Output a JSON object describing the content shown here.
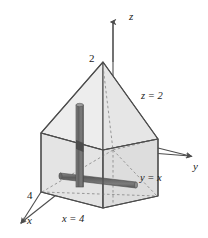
{
  "figure": {
    "background_color": "#ffffff",
    "stroke_color": "#4d4d4d",
    "dashed_color": "#8c8c8c",
    "face_fill_light": "#eeeeee",
    "face_fill_mid": "#e3e3e3",
    "face_fill_dark": "#d9d9d9",
    "rod_color": "#6e6e6e",
    "rod_shadow_color": "#4a4a4a",
    "axes": {
      "z": {
        "label": "z",
        "x": 129,
        "y": 20
      },
      "y": {
        "label": "y",
        "x": 193,
        "y": 160
      },
      "x": {
        "label": "x",
        "x": 27,
        "y": 221
      }
    },
    "tick_labels": [
      {
        "name": "z-tick-2",
        "text": "2",
        "x": 89,
        "y": 62
      },
      {
        "name": "x-tick-4",
        "text": "4",
        "x": 29,
        "y": 198
      }
    ],
    "plane_labels": [
      {
        "name": "plane-z-equals-2",
        "text": "z = 2",
        "x": 143,
        "y": 98
      },
      {
        "name": "plane-y-equals-x",
        "text": "y = x",
        "x": 142,
        "y": 180
      },
      {
        "name": "plane-x-equals-4",
        "text": "x = 4",
        "x": 66,
        "y": 219
      }
    ],
    "elements": [
      {
        "name": "vertical-rod",
        "orientation": "vertical"
      },
      {
        "name": "horizontal-rod",
        "orientation": "horizontal"
      }
    ]
  }
}
